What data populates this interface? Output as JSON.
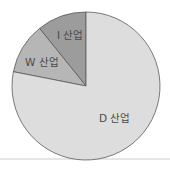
{
  "chart_data": {
    "type": "pie",
    "title": "",
    "categories": [
      "I 산업",
      "W 산업",
      "D 산업"
    ],
    "values": [
      10.8,
      11.1,
      78.1
    ],
    "colors": [
      "#9c9c9c",
      "#b6b6b6",
      "#dddddd"
    ],
    "outline_color": "#5a5a5a",
    "start_angle_deg": 0,
    "direction": "counterclockwise-from-top",
    "legend": "none (labels inside slices)"
  },
  "labels": {
    "i": "I 산업",
    "w": "W 산업",
    "d": "D 산업"
  }
}
